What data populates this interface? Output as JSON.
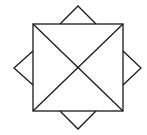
{
  "diagram": {
    "type": "geometric-figure",
    "colors": {
      "stroke": "#1a1a1a",
      "background": "#ffffff"
    },
    "square": {
      "x": 33,
      "y": 24,
      "width": 90,
      "height": 87,
      "corners": [
        [
          33,
          24
        ],
        [
          123,
          24
        ],
        [
          123,
          111
        ],
        [
          33,
          111
        ]
      ]
    },
    "diagonals": [
      {
        "from": [
          33,
          24
        ],
        "to": [
          123,
          111
        ]
      },
      {
        "from": [
          123,
          24
        ],
        "to": [
          33,
          111
        ]
      }
    ],
    "center": [
      78,
      68
    ],
    "diamond": {
      "vertices": {
        "top": [
          78,
          6
        ],
        "right": [
          141,
          68
        ],
        "bottom": [
          78,
          129
        ],
        "left": [
          14,
          68
        ]
      }
    },
    "triangles": [
      {
        "name": "top",
        "points": [
          [
            60,
            24
          ],
          [
            78,
            6
          ],
          [
            96,
            24
          ]
        ]
      },
      {
        "name": "right",
        "points": [
          [
            123,
            51
          ],
          [
            141,
            68
          ],
          [
            123,
            85
          ]
        ]
      },
      {
        "name": "bottom",
        "points": [
          [
            60,
            111
          ],
          [
            78,
            129
          ],
          [
            96,
            111
          ]
        ]
      },
      {
        "name": "left",
        "points": [
          [
            33,
            51
          ],
          [
            14,
            68
          ],
          [
            33,
            85
          ]
        ]
      }
    ]
  }
}
